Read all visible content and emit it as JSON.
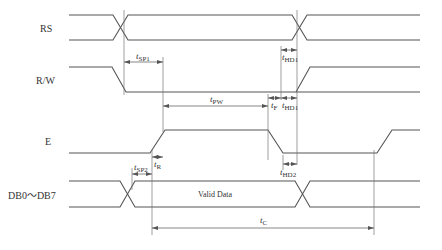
{
  "signals": {
    "rs": "RS",
    "rw": "R/W",
    "e": "E",
    "db": "DB0～DB7"
  },
  "data_bus_label": "Valid Data",
  "timings": {
    "tsp1": {
      "t": "t",
      "sub": "SP1"
    },
    "thd1_upper": {
      "t": "t",
      "sub": "HD1"
    },
    "tpw": {
      "t": "t",
      "sub": "PW"
    },
    "tf": {
      "t": "t",
      "sub": "F"
    },
    "thd1_lower": {
      "t": "t",
      "sub": "HD1"
    },
    "tr": {
      "t": "t",
      "sub": "R"
    },
    "tsp2": {
      "t": "t",
      "sub": "SP2"
    },
    "thd2": {
      "t": "t",
      "sub": "HD2"
    },
    "tc": {
      "t": "t",
      "sub": "C"
    }
  }
}
